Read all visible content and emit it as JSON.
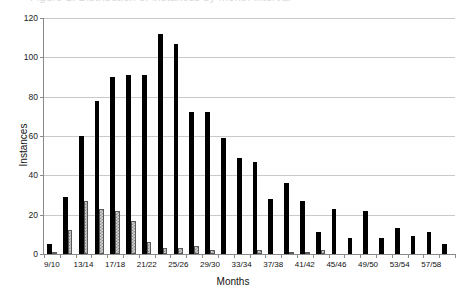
{
  "title": {
    "text": "Figure 1. Distribution of instances by month interval",
    "clipped": true
  },
  "axis_label_x": "Months",
  "axis_label_y": "Instances",
  "colors": {
    "series_1": "#000000",
    "series_2": "#d3d3d3",
    "gridline": "#c9c9c9",
    "axis": "#8a8a8a",
    "background": "#ffffff"
  },
  "chart_data": {
    "type": "bar",
    "title": "Figure 1. Distribution of instances by month interval",
    "xlabel": "Months",
    "ylabel": "Instances",
    "ylim": [
      0,
      120
    ],
    "ytick_labels": [
      "0",
      "20",
      "40",
      "60",
      "80",
      "100",
      "120"
    ],
    "yticks": [
      0,
      20,
      40,
      60,
      80,
      100,
      120
    ],
    "grid": true,
    "legend": "none",
    "categories": [
      "9/10",
      "11/12",
      "13/14",
      "15/16",
      "17/18",
      "19/20",
      "21/22",
      "23/24",
      "25/26",
      "27/28",
      "29/30",
      "31/32",
      "33/34",
      "35/36",
      "37/38",
      "39/40",
      "41/42",
      "43/44",
      "45/46",
      "47/48",
      "49/50",
      "51/52",
      "53/54",
      "55/56",
      "57/58",
      "59/60"
    ],
    "visible_tick_labels": [
      "9/10",
      "13/14",
      "17/18",
      "21/22",
      "25/26",
      "29/30",
      "33/34",
      "37/38",
      "41/42",
      "45/46",
      "49/50",
      "53/54",
      "57/58"
    ],
    "series": [
      {
        "name": "Series 1",
        "style": "solid-black",
        "values": [
          5,
          29,
          60,
          78,
          90,
          91,
          91,
          112,
          107,
          72,
          72,
          59,
          49,
          47,
          28,
          36,
          27,
          11,
          23,
          8,
          22,
          8,
          13,
          9,
          11,
          5
        ]
      },
      {
        "name": "Series 2",
        "style": "gray-hatched",
        "values": [
          1,
          12,
          27,
          23,
          22,
          17,
          6,
          3,
          3,
          4,
          2,
          0,
          0,
          2,
          0,
          1,
          1,
          2,
          0,
          0,
          0,
          0,
          0,
          0,
          0,
          0
        ]
      }
    ]
  }
}
